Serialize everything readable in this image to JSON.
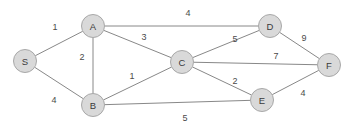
{
  "diagram": {
    "node_radius": 11.5,
    "colors": {
      "node_fill": "#d9d9d9",
      "node_stroke": "#a8a8a8",
      "edge_stroke": "#888888",
      "label_text": "#3a3a3a",
      "weight_text": "#4a4a4a",
      "background": "#ffffff"
    },
    "nodes": [
      {
        "id": "S",
        "label": "S",
        "x": 25,
        "y": 61
      },
      {
        "id": "A",
        "label": "A",
        "x": 93,
        "y": 26
      },
      {
        "id": "B",
        "label": "B",
        "x": 93,
        "y": 105
      },
      {
        "id": "C",
        "label": "C",
        "x": 182,
        "y": 62
      },
      {
        "id": "D",
        "label": "D",
        "x": 270,
        "y": 26
      },
      {
        "id": "E",
        "label": "E",
        "x": 262,
        "y": 100
      },
      {
        "id": "F",
        "label": "F",
        "x": 329,
        "y": 65
      }
    ],
    "edges": [
      {
        "from": "S",
        "to": "A",
        "weight": "1",
        "lx": 55,
        "ly": 27
      },
      {
        "from": "S",
        "to": "B",
        "weight": "4",
        "lx": 54,
        "ly": 100
      },
      {
        "from": "A",
        "to": "B",
        "weight": "2",
        "lx": 82,
        "ly": 57
      },
      {
        "from": "A",
        "to": "C",
        "weight": "3",
        "lx": 144,
        "ly": 37
      },
      {
        "from": "A",
        "to": "D",
        "weight": "4",
        "lx": 188,
        "ly": 13
      },
      {
        "from": "B",
        "to": "C",
        "weight": "1",
        "lx": 132,
        "ly": 76
      },
      {
        "from": "B",
        "to": "E",
        "weight": "5",
        "lx": 185,
        "ly": 118
      },
      {
        "from": "C",
        "to": "D",
        "weight": "5",
        "lx": 235,
        "ly": 39
      },
      {
        "from": "C",
        "to": "F",
        "weight": "7",
        "lx": 276,
        "ly": 56
      },
      {
        "from": "C",
        "to": "E",
        "weight": "2",
        "lx": 235,
        "ly": 81
      },
      {
        "from": "D",
        "to": "F",
        "weight": "9",
        "lx": 304,
        "ly": 38
      },
      {
        "from": "E",
        "to": "F",
        "weight": "4",
        "lx": 303,
        "ly": 93
      }
    ]
  }
}
